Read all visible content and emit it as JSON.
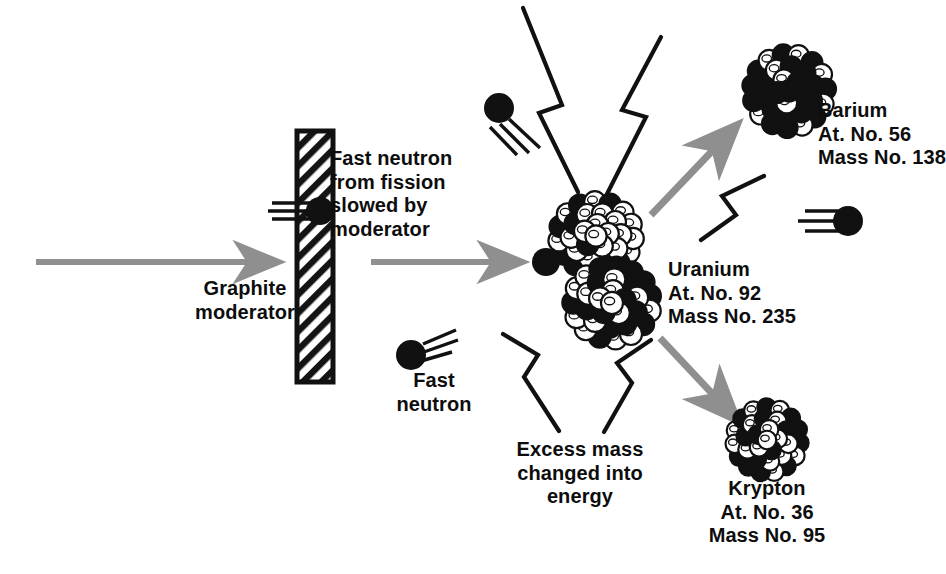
{
  "figure": {
    "kind": "nuclear-fission-chain-reaction-diagram",
    "background_color": "#ffffff",
    "ink_color": "#111111",
    "arrow_color": "#8f8f8f"
  },
  "labels": {
    "graphite_moderator": "Graphite\nmoderator",
    "fast_neutron_slowed": "Fast neutron\nfrom fission\nslowed by\nmoderator",
    "fast_neutron": "Fast\nneutron",
    "uranium": "Uranium\nAt. No. 92\nMass No. 235",
    "barium": "Barium\nAt. No. 56\nMass No. 138",
    "krypton": "Krypton\nAt. No. 36\nMass No. 95",
    "excess_mass": "Excess mass\nchanged into\nenergy"
  },
  "nuclei": [
    {
      "name": "uranium",
      "element": "Uranium",
      "atomic_number": 92,
      "mass_number": 235
    },
    {
      "name": "barium",
      "element": "Barium",
      "atomic_number": 56,
      "mass_number": 138
    },
    {
      "name": "krypton",
      "element": "Krypton",
      "atomic_number": 36,
      "mass_number": 95
    }
  ],
  "icons": {
    "moderator": "hatched-block-icon",
    "incoming_arrow": "arrow-right-icon",
    "slow_neutron_arrow": "arrow-right-icon",
    "barium_arrow": "arrow-up-right-icon",
    "krypton_arrow": "arrow-down-right-icon",
    "neutron": "neutron-dot-icon",
    "energy": "lightning-bolt-icon"
  }
}
